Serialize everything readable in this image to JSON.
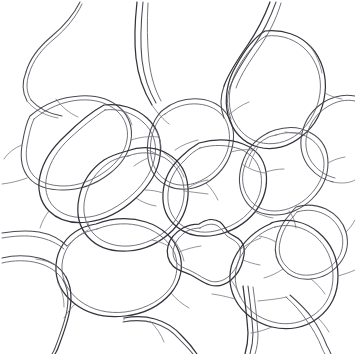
{
  "figure": {
    "width_px": 355,
    "height_px": 354,
    "background_color": "#ffffff",
    "line_color": "#4a4a52",
    "line_color_dark": "#33333b",
    "line_color_faint": "#7a7a84",
    "style": "ink-line-drawing",
    "cell_count_visible": 17
  },
  "cells": [
    {
      "id": "cell-top-left-corner",
      "label": "",
      "region": "top-left",
      "shape": "partial-rounded"
    },
    {
      "id": "cell-upper-left",
      "label": "",
      "region": "upper-left",
      "shape": "rounded-polygon"
    },
    {
      "id": "cell-left-large",
      "label": "",
      "region": "mid-left",
      "shape": "elongated-rounded"
    },
    {
      "id": "cell-mid-upper-center",
      "label": "",
      "region": "upper-center",
      "shape": "rounded-quad"
    },
    {
      "id": "cell-top-center-gap",
      "label": "",
      "region": "top-center",
      "shape": "partial-open"
    },
    {
      "id": "cell-top-right-round",
      "label": "",
      "region": "top-right",
      "shape": "oval"
    },
    {
      "id": "cell-right-upper",
      "label": "",
      "region": "right-upper",
      "shape": "partial-rounded"
    },
    {
      "id": "cell-center-left-round",
      "label": "",
      "region": "center-left",
      "shape": "rounded-polygon"
    },
    {
      "id": "cell-center-square",
      "label": "",
      "region": "center",
      "shape": "rounded-square"
    },
    {
      "id": "cell-center-right",
      "label": "",
      "region": "center-right",
      "shape": "rounded-polygon"
    },
    {
      "id": "cell-right-notched",
      "label": "",
      "region": "right-middle",
      "shape": "notched-polygon"
    },
    {
      "id": "cell-lower-left-big",
      "label": "",
      "region": "lower-left",
      "shape": "large-rounded"
    },
    {
      "id": "cell-lower-center-small",
      "label": "",
      "region": "lower-center",
      "shape": "small-lobed"
    },
    {
      "id": "cell-lower-right-big",
      "label": "",
      "region": "lower-right",
      "shape": "large-rounded"
    },
    {
      "id": "cell-bottom-left",
      "label": "",
      "region": "bottom-left",
      "shape": "partial-rounded"
    },
    {
      "id": "cell-bottom-center",
      "label": "",
      "region": "bottom-center",
      "shape": "partial-rounded"
    },
    {
      "id": "cell-bottom-right",
      "label": "",
      "region": "bottom-right",
      "shape": "partial-open"
    }
  ]
}
